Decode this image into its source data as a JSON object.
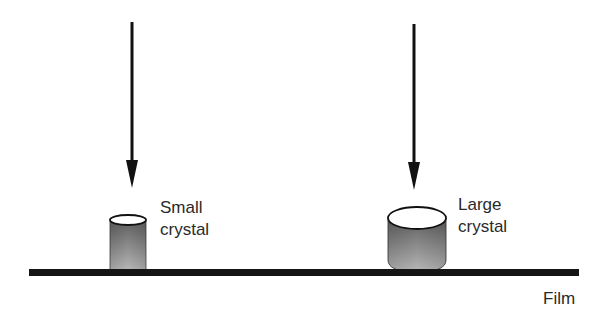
{
  "diagram": {
    "crystals": [
      {
        "id": "small",
        "label_line1": "Small",
        "label_line2": "crystal"
      },
      {
        "id": "large",
        "label_line1": "Large",
        "label_line2": "crystal"
      }
    ],
    "film_label": "Film",
    "colors": {
      "stroke": "#111111",
      "film": "#151515",
      "crystal_dark": "#5a5a5a",
      "crystal_light": "#c8c8c8",
      "text": "#2a2a2a"
    }
  }
}
